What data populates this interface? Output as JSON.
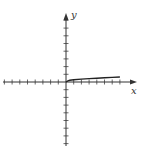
{
  "chart_data": {
    "type": "line",
    "title": "",
    "xlabel": "x",
    "ylabel": "y",
    "xlim": [
      -8,
      8
    ],
    "ylim": [
      -8,
      8
    ],
    "grid": false,
    "tick_marks": {
      "x_negative": 8,
      "x_positive": 7,
      "y_positive": 8,
      "y_negative": 8,
      "tick_labels": "none"
    },
    "series": [
      {
        "name": "curve",
        "x": [
          0,
          0.25,
          0.5,
          1,
          2,
          3,
          4,
          5,
          6,
          7
        ],
        "y": [
          0,
          0.15,
          0.22,
          0.3,
          0.38,
          0.44,
          0.5,
          0.55,
          0.6,
          0.65
        ]
      }
    ],
    "legend": "none"
  },
  "axes": {
    "x_label": "x",
    "y_label": "y"
  }
}
